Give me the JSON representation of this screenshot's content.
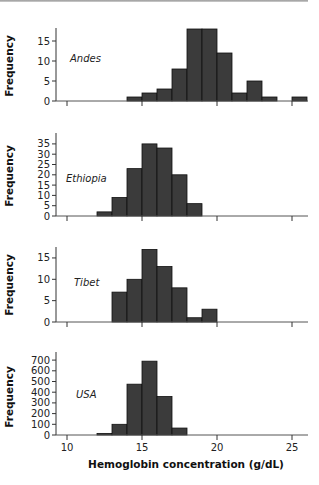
{
  "chart_data": {
    "type": "bar",
    "layout": "four vertically stacked histograms sharing x-axis",
    "xlabel": "Hemoglobin concentration (g/dL)",
    "xticks": [
      10,
      15,
      20,
      25
    ],
    "xlim": [
      9.5,
      26
    ],
    "bin_width": 1,
    "grid": false,
    "legend": null,
    "bar_color": "#3b3b3b",
    "bar_edge_color": "#111111",
    "panels": [
      {
        "name": "Andes",
        "ylabel": "Frequency",
        "yticks": [
          0,
          5,
          10,
          15
        ],
        "ylim": [
          0,
          18
        ],
        "bin_starts": [
          14,
          15,
          16,
          17,
          18,
          19,
          20,
          21,
          22,
          23,
          24,
          25
        ],
        "values": [
          1,
          2,
          3,
          8,
          18,
          18,
          12,
          2,
          5,
          1,
          0,
          1
        ]
      },
      {
        "name": "Ethiopia",
        "ylabel": "Frequency",
        "yticks": [
          0,
          5,
          10,
          15,
          20,
          25,
          30,
          35
        ],
        "ylim": [
          0,
          40
        ],
        "bin_starts": [
          12,
          13,
          14,
          15,
          16,
          17,
          18
        ],
        "values": [
          2,
          9,
          23,
          35,
          33,
          20,
          6
        ]
      },
      {
        "name": "Tibet",
        "ylabel": "Frequency",
        "yticks": [
          0,
          5,
          10,
          15
        ],
        "ylim": [
          0,
          17
        ],
        "bin_starts": [
          13,
          14,
          15,
          16,
          17,
          18,
          19
        ],
        "values": [
          7,
          10,
          17,
          13,
          8,
          1,
          3
        ]
      },
      {
        "name": "USA",
        "ylabel": "Frequency",
        "yticks": [
          0,
          100,
          200,
          300,
          400,
          500,
          600,
          700
        ],
        "ylim": [
          0,
          750
        ],
        "bin_starts": [
          12,
          13,
          14,
          15,
          16,
          17
        ],
        "values": [
          15,
          100,
          475,
          690,
          360,
          65
        ]
      }
    ]
  },
  "geometry": {
    "x_axis_left": 56,
    "x_axis_right": 308,
    "x_at_10": 67,
    "px_per_unit_x": 15,
    "panels": [
      {
        "baseline": 101,
        "axis_top": 28,
        "px_per_unit_y": 4.0,
        "label_x": 70,
        "label_y": 62,
        "ylabel_cy": 66
      },
      {
        "baseline": 216,
        "axis_top": 133,
        "px_per_unit_y": 2.06,
        "label_x": 66,
        "label_y": 182,
        "ylabel_cy": 176
      },
      {
        "baseline": 322,
        "axis_top": 247,
        "px_per_unit_y": 4.27,
        "label_x": 74,
        "label_y": 286,
        "ylabel_cy": 285
      },
      {
        "baseline": 435,
        "axis_top": 352,
        "px_per_unit_y": 0.107,
        "label_x": 76,
        "label_y": 398,
        "ylabel_cy": 397
      }
    ],
    "xtick_label_y": 451,
    "xlabel_y": 468
  }
}
